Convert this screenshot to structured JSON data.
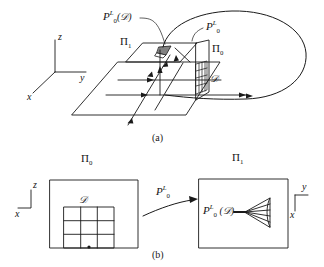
{
  "figure": {
    "ink_color": "#1a1a1a",
    "background": "#ffffff"
  },
  "panel_a": {
    "caption": "(a)",
    "labels": {
      "image_region": "P₀ᴸ(𝒟)",
      "image_region_parts": {
        "base": "P",
        "sup": "L",
        "sub": "0",
        "arg": "(𝒟)"
      },
      "map": "P₀ᴸ",
      "map_parts": {
        "base": "P",
        "sup": "L",
        "sub": "0"
      },
      "plane_1": "Π₁",
      "plane_1_parts": {
        "base": "Π",
        "sub": "1"
      },
      "plane_0": "Π₀",
      "plane_0_parts": {
        "base": "Π",
        "sub": "0"
      },
      "domain": "𝒟"
    },
    "axes": {
      "z": "z",
      "y": "y",
      "x": "x"
    }
  },
  "panel_b": {
    "caption": "(b)",
    "labels": {
      "plane_0": "Π₀",
      "plane_0_parts": {
        "base": "Π",
        "sub": "0"
      },
      "plane_1": "Π₁",
      "plane_1_parts": {
        "base": "Π",
        "sub": "1"
      },
      "domain": "𝒟",
      "map": "P₀ᴸ",
      "map_parts": {
        "base": "P",
        "sup": "L",
        "sub": "0"
      },
      "image_region": "P₀ᴸ (𝒟)",
      "image_region_parts": {
        "base": "P",
        "sup": "L",
        "sub": "0",
        "arg": "(𝒟)"
      }
    },
    "axes_left": {
      "z": "z",
      "x": "x"
    },
    "axes_right": {
      "y": "y",
      "x": "x"
    },
    "grid": {
      "rows": 3,
      "cols": 3
    }
  }
}
